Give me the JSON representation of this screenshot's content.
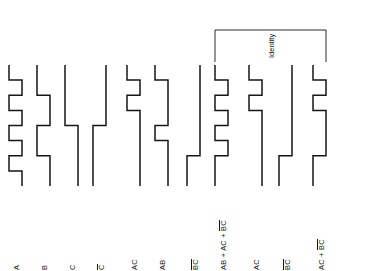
{
  "figure": {
    "kind": "digital-logic-timing-waveform-diagram",
    "orientation": "rotated-90-ccw",
    "time_slots": 8,
    "line_color": "#161616",
    "background_color": "#ffffff"
  },
  "annotation": {
    "bracket_label": "Identity",
    "bracket_spans_waveforms": [
      8,
      11
    ]
  },
  "waveforms": [
    {
      "id": "A",
      "label_main": "A",
      "label_overbar": "",
      "levels": [
        1,
        0,
        1,
        0,
        1,
        0,
        1,
        0
      ]
    },
    {
      "id": "B",
      "label_main": "B",
      "label_overbar": "",
      "levels": [
        1,
        1,
        0,
        0,
        1,
        1,
        0,
        0
      ]
    },
    {
      "id": "C",
      "label_main": "C",
      "label_overbar": "",
      "levels": [
        1,
        1,
        1,
        1,
        0,
        0,
        0,
        0
      ]
    },
    {
      "id": "Cbar",
      "label_main": "C",
      "label_overbar": "C",
      "levels": [
        0,
        0,
        0,
        0,
        1,
        1,
        1,
        1
      ]
    },
    {
      "id": "AC",
      "label_main": "AC",
      "label_overbar": "",
      "levels": [
        1,
        0,
        1,
        0,
        0,
        0,
        0,
        0
      ]
    },
    {
      "id": "AB",
      "label_main": "AB",
      "label_overbar": "",
      "levels": [
        1,
        0,
        0,
        0,
        1,
        0,
        0,
        0
      ]
    },
    {
      "id": "BbarCbar",
      "label_main": "BC",
      "label_overbar": "BC",
      "levels": [
        0,
        0,
        0,
        0,
        0,
        0,
        1,
        1
      ]
    },
    {
      "id": "AB+AC+BbarCbar",
      "label_main": "AB + AC + BC",
      "label_overbar": "BC",
      "levels": [
        1,
        0,
        1,
        0,
        1,
        0,
        1,
        1
      ]
    },
    {
      "id": "AC2",
      "label_main": "AC",
      "label_overbar": "",
      "levels": [
        1,
        0,
        1,
        0,
        0,
        0,
        0,
        0
      ]
    },
    {
      "id": "BbarCbar2",
      "label_main": "BC",
      "label_overbar": "BC",
      "levels": [
        0,
        0,
        0,
        0,
        0,
        0,
        1,
        1
      ]
    },
    {
      "id": "AC+BbarCbar",
      "label_main": "AC + BC",
      "label_overbar": "BC",
      "levels": [
        1,
        0,
        1,
        0,
        0,
        0,
        1,
        1
      ]
    }
  ],
  "labels": {
    "w0": "A",
    "w1": "B",
    "w2": "C",
    "w3": "C",
    "w4": "AC",
    "w5": "AB",
    "w6_pre": "",
    "w6_bar": "BC",
    "w7_pre": "AB + AC + ",
    "w7_bar": "BC",
    "w8": "AC",
    "w9_bar": "BC",
    "w10_pre": "AC + ",
    "w10_bar": "BC",
    "identity": "Identity"
  }
}
